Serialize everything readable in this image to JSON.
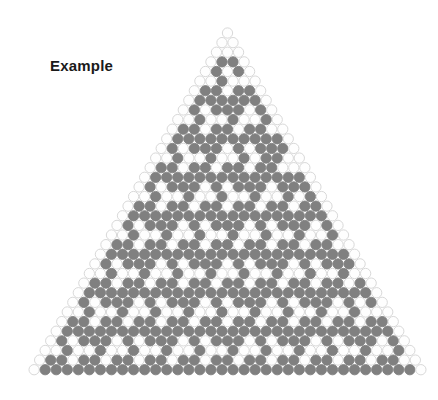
{
  "page": {
    "background_color": "#ffffff",
    "width": 438,
    "height": 400
  },
  "label": {
    "text": "Example",
    "color": "#1a1a1a",
    "font_size_px": 15,
    "font_weight": "bold",
    "x": 50,
    "y": 57
  },
  "figure": {
    "name": "pascal-triangle-mod-3-hex-grid",
    "type": "cellular-triangle",
    "rows": 36,
    "apex_x": 227.5,
    "apex_y": 33,
    "cell_pitch_x": 11.05,
    "cell_pitch_y": 9.62,
    "cell_radius": 5.15,
    "cell_shape": "circle",
    "empty_fill": "#fefefe",
    "empty_stroke": "#d4d4d4",
    "empty_stroke_width": 0.9,
    "marked_fill": "#808080",
    "marked_stroke": "#808080",
    "marked_stroke_width": 0.9,
    "rule": "binomial_mod",
    "modulus": 3,
    "marked_when_residue": 0
  },
  "chart_data": {
    "type": "heatmap",
    "title": "Example",
    "xlabel": "",
    "ylabel": "",
    "rows": 36,
    "modulus": 3,
    "marked_residue": 0,
    "legend": [
      {
        "label": "C(n,k) mod 3 = 0",
        "color": "#808080"
      },
      {
        "label": "C(n,k) mod 3 ≠ 0",
        "color": "#fefefe"
      }
    ],
    "row_marked_positions": [
      [],
      [],
      [],
      [
        1,
        2
      ],
      [
        1,
        3
      ],
      [
        2
      ],
      [
        1,
        2,
        4,
        5
      ],
      [
        1,
        2,
        3,
        4,
        5,
        6
      ],
      [
        1,
        3,
        4,
        5,
        7
      ],
      [
        2,
        5,
        8
      ],
      [
        1,
        2,
        4,
        5,
        7,
        8
      ],
      [
        1,
        2,
        3,
        4,
        5,
        6,
        7,
        8,
        9,
        10
      ],
      [
        1,
        3,
        4,
        5,
        7,
        9,
        10,
        11
      ],
      [
        2,
        5,
        8,
        10,
        11
      ],
      [
        1,
        2,
        4,
        5,
        7,
        8,
        10,
        11
      ],
      [
        1,
        2,
        3,
        4,
        5,
        6,
        7,
        8,
        9,
        10,
        11,
        12,
        13,
        14
      ],
      [
        1,
        3,
        4,
        5,
        7,
        9,
        10,
        11,
        13,
        14,
        15
      ],
      [
        2,
        5,
        8,
        11,
        14,
        16
      ],
      [
        1,
        2,
        4,
        5,
        7,
        8,
        10,
        11,
        13,
        14,
        16,
        17
      ],
      [
        1,
        2,
        3,
        4,
        5,
        6,
        7,
        8,
        9,
        10,
        11,
        12,
        13,
        14,
        15,
        16,
        17,
        18
      ],
      [
        1,
        3,
        4,
        5,
        7,
        9,
        10,
        11,
        13,
        15,
        16,
        17,
        19
      ],
      [
        2,
        5,
        8,
        11,
        14,
        17,
        20
      ],
      [
        1,
        2,
        4,
        5,
        7,
        8,
        10,
        11,
        13,
        14,
        16,
        17,
        19,
        20
      ],
      [
        1,
        2,
        3,
        4,
        5,
        6,
        7,
        8,
        9,
        10,
        11,
        12,
        13,
        14,
        15,
        16,
        17,
        18,
        19,
        20,
        21,
        22
      ],
      [
        1,
        3,
        4,
        5,
        7,
        9,
        10,
        11,
        13,
        15,
        16,
        17,
        19,
        21,
        22,
        23
      ],
      [
        2,
        5,
        8,
        11,
        14,
        17,
        20,
        23
      ],
      [
        1,
        2,
        4,
        5,
        7,
        8,
        10,
        11,
        13,
        14,
        16,
        17,
        19,
        20,
        22,
        23,
        25
      ],
      [
        1,
        2,
        3,
        4,
        5,
        6,
        7,
        8,
        9,
        10,
        11,
        12,
        13,
        14,
        15,
        16,
        17,
        18,
        19,
        20,
        21,
        22,
        23,
        24,
        25,
        26
      ],
      [
        1,
        3,
        4,
        5,
        7,
        9,
        10,
        11,
        13,
        15,
        16,
        17,
        19,
        21,
        22,
        23,
        25,
        27
      ],
      [
        2,
        5,
        8,
        11,
        14,
        17,
        20,
        23,
        26
      ],
      [
        1,
        2,
        4,
        5,
        7,
        8,
        10,
        11,
        13,
        14,
        16,
        17,
        19,
        20,
        22,
        23,
        25,
        26,
        28,
        29
      ],
      [
        1,
        2,
        3,
        4,
        5,
        6,
        7,
        8,
        9,
        10,
        11,
        12,
        13,
        14,
        15,
        16,
        17,
        18,
        19,
        20,
        21,
        22,
        23,
        24,
        25,
        26,
        27,
        28,
        29,
        30
      ],
      [
        1,
        3,
        4,
        5,
        7,
        9,
        10,
        11,
        13,
        15,
        16,
        17,
        19,
        21,
        22,
        23,
        25,
        27,
        28,
        29,
        31
      ],
      [
        2,
        5,
        8,
        11,
        14,
        17,
        20,
        23,
        26,
        29,
        32
      ],
      [
        1,
        2,
        4,
        5,
        7,
        8,
        10,
        11,
        13,
        14,
        16,
        17,
        19,
        20,
        22,
        23,
        25,
        26,
        28,
        29,
        31,
        32
      ],
      [
        1,
        2,
        3,
        4,
        5,
        6,
        7,
        8,
        9,
        10,
        11,
        12,
        13,
        14,
        15,
        16,
        17,
        18,
        19,
        20,
        21,
        22,
        23,
        24,
        25,
        26,
        27,
        28,
        29,
        30,
        31,
        32,
        33,
        34
      ]
    ]
  }
}
